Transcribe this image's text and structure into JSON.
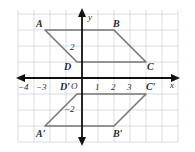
{
  "figure": {
    "kind": "coordinate-plane-reflection-diagram",
    "background": "#ffffff",
    "grid_color": "#c9d4e4",
    "axis_color": "#1a1a1a",
    "shape_color": "#6b6b6b",
    "label_color": "#2b2b2b"
  },
  "axes": {
    "x_label": "x",
    "y_label": "y",
    "origin_label": "O",
    "x_ticks": [
      {
        "label": "−4",
        "value": -4
      },
      {
        "label": "−3",
        "value": -3
      },
      {
        "label": "1",
        "value": 1
      },
      {
        "label": "2",
        "value": 2
      },
      {
        "label": "3",
        "value": 3
      }
    ],
    "y_ticks": [
      {
        "label": "2",
        "value": 2
      },
      {
        "label": "−2",
        "value": -2
      }
    ],
    "x_range": [
      -5,
      5
    ],
    "y_range": [
      -4,
      4
    ]
  },
  "shapes": [
    {
      "name": "ABCD",
      "vertex_labels": [
        "A",
        "B",
        "C",
        "D"
      ],
      "vertices": [
        {
          "label": "A",
          "x": -2.3,
          "y": 3
        },
        {
          "label": "B",
          "x": 2,
          "y": 3
        },
        {
          "label": "C",
          "x": 4,
          "y": 1
        },
        {
          "label": "D",
          "x": -0.3,
          "y": 1
        }
      ]
    },
    {
      "name": "A'B'C'D'",
      "vertex_labels": [
        "A′",
        "B′",
        "C′",
        "D′"
      ],
      "vertices": [
        {
          "label": "A′",
          "x": -2.3,
          "y": -3
        },
        {
          "label": "B′",
          "x": 2,
          "y": -3
        },
        {
          "label": "C′",
          "x": 4,
          "y": -1
        },
        {
          "label": "D′",
          "x": -0.3,
          "y": -1
        }
      ]
    }
  ],
  "vertex_label_text": {
    "A": "A",
    "B": "B",
    "C": "C",
    "D": "D",
    "Ap": "A′",
    "Bp": "B′",
    "Cp": "C′",
    "Dp": "D′"
  }
}
